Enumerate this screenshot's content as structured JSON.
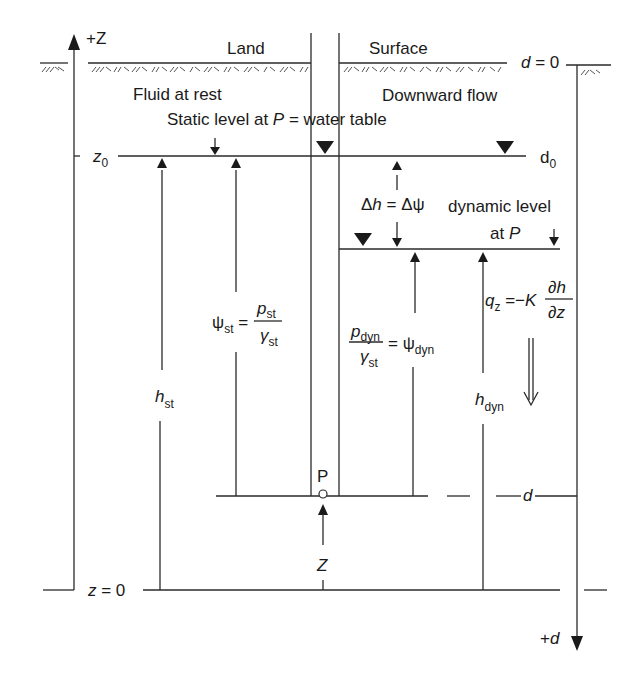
{
  "diagram": {
    "type": "hydraulic head schematic (downward flow in a well/piezometer)",
    "labels": {
      "z_axis_top": "+Z",
      "land": "Land",
      "surface": "Surface",
      "d_zero": "d = 0",
      "fluid_at_rest": "Fluid at rest",
      "downward_flow": "Downward flow",
      "static_level": "Static level at P = water table",
      "z0": "z",
      "z0_sub": "0",
      "d0": "d",
      "d0_sub": "0",
      "delta": "Δh = Δψ",
      "dynamic_level_line1": "dynamic level",
      "dynamic_level_line2": "at P",
      "psi_st_lhs": "ψ",
      "psi_st_lhs_sub": "st",
      "psi_st_num": "p",
      "psi_st_num_sub": "st",
      "psi_st_den": "γ",
      "psi_st_den_sub": "st",
      "pdyn_num": "p",
      "pdyn_num_sub": "dyn",
      "pdyn_den": "γ",
      "pdyn_den_sub": "st",
      "psi_dyn": "ψ",
      "psi_dyn_sub": "dyn",
      "qz_lhs": "q",
      "qz_sub": "z",
      "qz_eq": "= −K",
      "qz_num": "∂h",
      "qz_den": "∂z",
      "h_st": "h",
      "h_st_sub": "st",
      "h_dyn": "h",
      "h_dyn_sub": "dyn",
      "point_p": "P",
      "z_label": "Z",
      "d_label": "d",
      "z_zero": "z = 0",
      "d_axis_bottom": "+d"
    },
    "colors": {
      "line": "#2a2a2a",
      "background": "#ffffff"
    }
  }
}
